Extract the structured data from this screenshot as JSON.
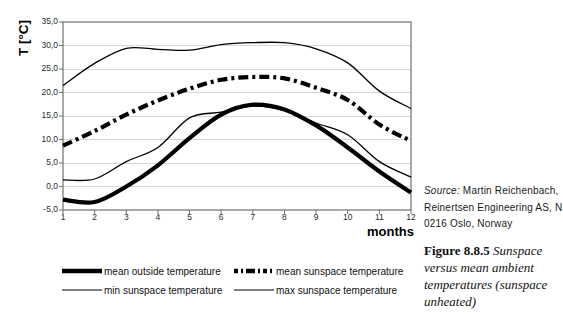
{
  "figure": {
    "y_ticks": [
      "35,0",
      "30,0",
      "25,0",
      "20,0",
      "15,0",
      "10,0",
      "5,0",
      "0,0",
      "-5,0"
    ],
    "x_ticks": [
      "1",
      "2",
      "3",
      "4",
      "5",
      "6",
      "7",
      "8",
      "9",
      "10",
      "11",
      "12"
    ]
  },
  "chart_data": {
    "type": "line",
    "title": "",
    "xlabel": "months",
    "ylabel": "T [°C]",
    "x": [
      1,
      2,
      3,
      4,
      5,
      6,
      7,
      8,
      9,
      10,
      11,
      12
    ],
    "ylim": [
      -5,
      35
    ],
    "ytick_step": 5,
    "grid": true,
    "legend_position": "bottom",
    "series": [
      {
        "name": "mean outside temperature",
        "style": "thick-solid",
        "values": [
          -2.8,
          -3.3,
          0.0,
          4.5,
          10.3,
          15.3,
          17.4,
          16.4,
          13.0,
          8.3,
          3.2,
          -1.3
        ]
      },
      {
        "name": "mean sunspace temperature",
        "style": "thick-dashdot",
        "values": [
          8.7,
          11.8,
          15.3,
          18.3,
          20.8,
          22.7,
          23.3,
          23.0,
          21.0,
          18.4,
          13.2,
          9.7
        ]
      },
      {
        "name": "min sunspace temperature",
        "style": "thin-solid",
        "values": [
          1.4,
          1.6,
          5.3,
          8.3,
          14.6,
          15.8,
          17.1,
          16.2,
          13.5,
          11.0,
          5.3,
          2.0
        ]
      },
      {
        "name": "max sunspace temperature",
        "style": "thin-solid",
        "values": [
          21.5,
          26.2,
          29.4,
          29.2,
          29.0,
          30.2,
          30.6,
          30.6,
          29.3,
          26.3,
          20.3,
          16.6
        ]
      }
    ]
  },
  "legend": {
    "items": [
      {
        "label": "mean outside temperature",
        "style": "thick-solid"
      },
      {
        "label": "mean sunspace temperature",
        "style": "thick-dashdot"
      },
      {
        "label": "min sunspace temperature",
        "style": "thin-solid"
      },
      {
        "label": "max sunspace temperature",
        "style": "thin-solid"
      }
    ]
  },
  "sidebar": {
    "source_label": "Source:",
    "source_line1_rest": " Martin Reichenbach,",
    "source_line2": "Reinertsen Engineering AS, N",
    "source_line3": "0216 Oslo, Norway",
    "caption_label": "Figure 8.8.5",
    "caption_text": " Sunspace versus mean ambient temperatures (sunspace unheated)"
  },
  "colors": {
    "line": "#000000",
    "frame": "#707070",
    "grid": "#d6d6d6",
    "background": "#ffffff"
  }
}
